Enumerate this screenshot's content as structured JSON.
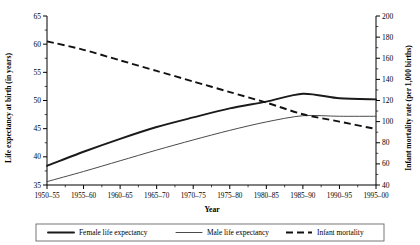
{
  "chart_data": {
    "type": "line",
    "title": "",
    "xlabel": "Year",
    "ylabel": "Life expectancy at birth (in years)",
    "y2label": "Infant mortality rate (per 1,000 births)",
    "categories": [
      "1950–55",
      "1955–60",
      "1960–65",
      "1965–70",
      "1970–75",
      "1975–80",
      "1980–85",
      "1985–90",
      "1990–95",
      "1995–00"
    ],
    "ylim": [
      35,
      65
    ],
    "yticks": [
      35,
      40,
      45,
      50,
      55,
      60,
      65
    ],
    "y2lim": [
      40,
      200
    ],
    "y2ticks": [
      40,
      60,
      80,
      100,
      120,
      140,
      160,
      180,
      200
    ],
    "grid": false,
    "legend_position": "bottom",
    "series": [
      {
        "name": "Female life expectancy",
        "axis": "left",
        "style": "solid-thick",
        "color": "#1a1a1a",
        "values": [
          38.4,
          40.9,
          43.2,
          45.3,
          47.0,
          48.6,
          49.8,
          51.2,
          50.4,
          50.2
        ]
      },
      {
        "name": "Male life expectancy",
        "axis": "left",
        "style": "solid-thin",
        "color": "#4a4a4a",
        "values": [
          35.6,
          37.4,
          39.3,
          41.2,
          43.0,
          44.7,
          46.2,
          47.3,
          47.2,
          47.2
        ]
      },
      {
        "name": "Infant mortality",
        "axis": "right",
        "style": "dashed",
        "color": "#111111",
        "values": [
          176,
          168,
          158,
          148,
          138,
          128,
          118,
          107,
          100,
          93
        ]
      }
    ]
  },
  "legend": {
    "items": [
      {
        "label": "Female life expectancy"
      },
      {
        "label": "Male life expectancy"
      },
      {
        "label": "Infant mortality"
      }
    ]
  }
}
